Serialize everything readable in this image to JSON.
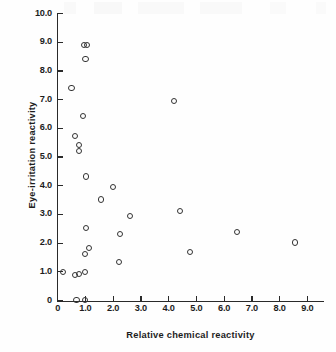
{
  "chart_data": {
    "type": "scatter",
    "title": "",
    "xlabel": "Relative chemical reactivity",
    "ylabel": "Eye-irritation reactivity",
    "xlim": [
      0,
      9.6
    ],
    "ylim": [
      0,
      10.0
    ],
    "xticks": [
      0,
      1.0,
      2.0,
      3.0,
      4.0,
      5.0,
      6.0,
      7.0,
      8.0,
      9.0
    ],
    "xticklabels": [
      "0",
      "1.0",
      "2.0",
      "3.0",
      "4.0",
      "5.0",
      "6.0",
      "7.0",
      "8.0",
      "9.0"
    ],
    "yticks": [
      0,
      1.0,
      2.0,
      3.0,
      4.0,
      5.0,
      6.0,
      7.0,
      8.0,
      9.0,
      10.0
    ],
    "yticklabels": [
      "0",
      "1.0",
      "2.0",
      "3.0",
      "4.0",
      "5.0",
      "6.0",
      "7.0",
      "8.0",
      "9.0",
      "10.0"
    ],
    "grid": false,
    "legend": null,
    "marker": "open-circle",
    "marker_color": "#333333",
    "points": [
      {
        "x": 0.95,
        "y": 8.9
      },
      {
        "x": 1.05,
        "y": 8.9
      },
      {
        "x": 1.0,
        "y": 8.42
      },
      {
        "x": 0.5,
        "y": 7.4
      },
      {
        "x": 4.2,
        "y": 6.95
      },
      {
        "x": 0.92,
        "y": 6.42
      },
      {
        "x": 0.62,
        "y": 5.72
      },
      {
        "x": 0.78,
        "y": 5.42
      },
      {
        "x": 0.78,
        "y": 5.22
      },
      {
        "x": 1.02,
        "y": 4.32
      },
      {
        "x": 1.98,
        "y": 3.95
      },
      {
        "x": 1.55,
        "y": 3.52
      },
      {
        "x": 4.4,
        "y": 3.13
      },
      {
        "x": 2.6,
        "y": 2.95
      },
      {
        "x": 1.02,
        "y": 2.52
      },
      {
        "x": 2.25,
        "y": 2.33
      },
      {
        "x": 6.45,
        "y": 2.4
      },
      {
        "x": 8.55,
        "y": 2.02
      },
      {
        "x": 1.12,
        "y": 1.82
      },
      {
        "x": 4.78,
        "y": 1.68
      },
      {
        "x": 0.98,
        "y": 1.63
      },
      {
        "x": 2.22,
        "y": 1.33
      },
      {
        "x": 0.2,
        "y": 1.0
      },
      {
        "x": 0.98,
        "y": 1.0
      },
      {
        "x": 0.62,
        "y": 0.88
      },
      {
        "x": 0.78,
        "y": 0.92
      },
      {
        "x": 0.68,
        "y": 0.02
      },
      {
        "x": 0.98,
        "y": 0.02
      }
    ]
  }
}
